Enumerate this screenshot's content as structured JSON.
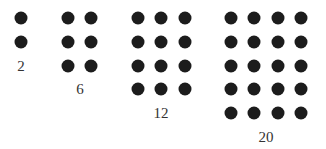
{
  "diagram": {
    "title": "",
    "dot_color": "#1c1c1c",
    "label_color": "#333333",
    "dot_spacing_x": 23.3,
    "dot_spacing_y": 23.75,
    "first_row_y": 18,
    "groups": [
      {
        "label": "2",
        "cols": 1,
        "rows": 2,
        "x0": 21,
        "label_x": 21
      },
      {
        "label": "6",
        "cols": 2,
        "rows": 3,
        "x0": 68,
        "label_x": 80
      },
      {
        "label": "12",
        "cols": 3,
        "rows": 4,
        "x0": 138,
        "label_x": 161
      },
      {
        "label": "20",
        "cols": 4,
        "rows": 5,
        "x0": 231,
        "label_x": 266
      }
    ]
  }
}
